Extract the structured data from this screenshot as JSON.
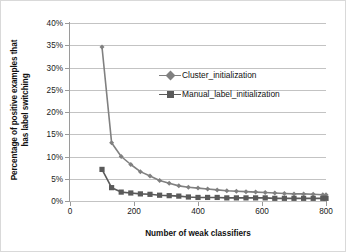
{
  "chart_data": {
    "type": "line",
    "title": "",
    "xlabel": "Number of weak classifiers",
    "ylabel": "Percentage of positive examples that has label switching",
    "ylabel_line1": "Percentage of positive examples that",
    "ylabel_line2": "has label switching",
    "xlim": [
      0,
      800
    ],
    "ylim": [
      0,
      40
    ],
    "xticks": [
      0,
      200,
      400,
      600,
      800
    ],
    "xtick_labels": [
      "0",
      "200",
      "400",
      "600",
      "800"
    ],
    "yticks": [
      0,
      5,
      10,
      15,
      20,
      25,
      30,
      35,
      40
    ],
    "ytick_labels": [
      "0%",
      "5%",
      "10%",
      "15%",
      "20%",
      "25%",
      "30%",
      "35%",
      "40%"
    ],
    "grid": "horizontal",
    "legend_position": "inside-upper-right",
    "series": [
      {
        "name": "Cluster_initialization",
        "color": "#808080",
        "marker": "diamond",
        "x": [
          100,
          130,
          160,
          190,
          220,
          250,
          280,
          310,
          340,
          370,
          400,
          430,
          460,
          490,
          520,
          550,
          580,
          610,
          640,
          670,
          700,
          730,
          760,
          790,
          800
        ],
        "values": [
          34.6,
          13.1,
          10.0,
          8.2,
          6.6,
          5.6,
          4.6,
          4.0,
          3.4,
          3.1,
          2.9,
          2.7,
          2.5,
          2.3,
          2.2,
          2.1,
          2.0,
          1.9,
          1.8,
          1.7,
          1.6,
          1.6,
          1.5,
          1.4,
          1.4
        ]
      },
      {
        "name": "Manual_label_initialization",
        "color": "#5a5a5a",
        "marker": "square",
        "x": [
          100,
          130,
          160,
          190,
          220,
          250,
          280,
          310,
          340,
          370,
          400,
          430,
          460,
          490,
          520,
          550,
          580,
          610,
          640,
          670,
          700,
          730,
          760,
          790,
          800
        ],
        "values": [
          7.1,
          3.0,
          2.0,
          1.8,
          1.6,
          1.5,
          1.3,
          1.2,
          1.1,
          0.9,
          0.8,
          0.8,
          0.8,
          0.7,
          0.7,
          0.7,
          0.7,
          0.7,
          0.6,
          0.6,
          0.6,
          0.6,
          0.6,
          0.6,
          0.6
        ]
      }
    ]
  },
  "legend": {
    "items": [
      {
        "label": "Cluster_initialization"
      },
      {
        "label": "Manual_label_initialization"
      }
    ]
  }
}
